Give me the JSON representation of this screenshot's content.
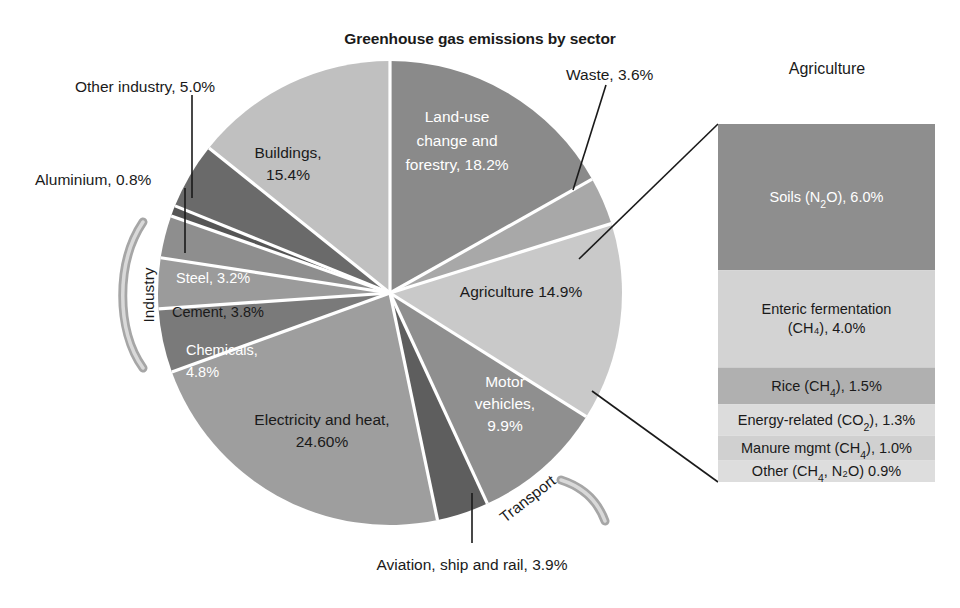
{
  "title": "Greenhouse gas emissions by sector",
  "panel_title": "Agriculture",
  "bracket_labels": {
    "industry": "Industry",
    "transport": "Transport"
  },
  "colors": {
    "land_use": "#8a8a8a",
    "waste": "#a8a8a8",
    "agriculture": "#c9c9c9",
    "motor_vehicles": "#8f8f8f",
    "aviation": "#5e5e5e",
    "electricity": "#9e9e9e",
    "chemicals": "#7a7a7a",
    "cement": "#9b9b9b",
    "steel": "#8e8e8e",
    "aluminium": "#555555",
    "other_industry": "#6a6a6a",
    "buildings": "#c0c0c0",
    "soils": "#8e8e8e",
    "enteric": "#d3d3d3",
    "rice": "#b0b0b0",
    "energy_related": "#dcdcdc",
    "manure": "#d0d0d0",
    "other_ag": "#dddddd",
    "separator": "#ffffff",
    "text_dark": "#1a1a1a",
    "text_light": "#ffffff"
  },
  "chart_data": {
    "type": "pie",
    "title": "Greenhouse gas emissions by sector",
    "xlabel": "",
    "ylabel": "",
    "legend": "none",
    "grid": false,
    "categories": [
      "Land-use change and forestry",
      "Waste",
      "Agriculture",
      "Motor vehicles",
      "Aviation, ship and rail",
      "Electricity and heat",
      "Chemicals",
      "Cement",
      "Steel",
      "Aluminium",
      "Other industry",
      "Buildings"
    ],
    "values": [
      18.2,
      3.6,
      14.9,
      9.9,
      3.9,
      24.6,
      4.8,
      3.8,
      3.2,
      0.8,
      5.0,
      15.4
    ],
    "slice_labels": [
      "Land-use change and forestry, 18.2%",
      "Waste, 3.6%",
      "Agriculture 14.9%",
      "Motor vehicles, 9.9%",
      "Aviation, ship and rail, 3.9%",
      "Electricity and heat, 24.60%",
      "Chemicals, 4.8%",
      "Cement, 3.8%",
      "Steel, 3.2%",
      "Aluminium, 0.8%",
      "Other industry, 5.0%",
      "Buildings, 15.4%"
    ],
    "groups": [
      {
        "name": "Industry",
        "members": [
          "Chemicals",
          "Cement",
          "Steel",
          "Aluminium",
          "Other industry"
        ]
      },
      {
        "name": "Transport",
        "members": [
          "Motor vehicles",
          "Aviation, ship and rail"
        ]
      }
    ]
  },
  "breakout": {
    "type": "stacked_bar",
    "title": "Agriculture",
    "parent_slice": "Agriculture",
    "parent_total": 14.9,
    "categories": [
      "Soils (N2O)",
      "Enteric fermentation (CH4)",
      "Rice (CH4)",
      "Energy-related (CO2)",
      "Manure mgmt (CH4)",
      "Other (CH4, N2O)"
    ],
    "values": [
      6.0,
      4.0,
      1.5,
      1.3,
      1.0,
      0.9
    ],
    "segments": [
      {
        "label_pre": "Soils (N",
        "sub": "2",
        "label_post": "O), 6.0%",
        "value": 6.0,
        "color": "#8e8e8e",
        "text": "#ffffff",
        "lines": 1
      },
      {
        "label_pre": "Enteric fermentation",
        "sub": "",
        "label_post": "(CH₄), 4.0%",
        "value": 4.0,
        "color": "#d3d3d3",
        "text": "#1a1a1a",
        "lines": 2
      },
      {
        "label_pre": "Rice (CH",
        "sub": "4",
        "label_post": "), 1.5%",
        "value": 1.5,
        "color": "#b0b0b0",
        "text": "#1a1a1a",
        "lines": 1
      },
      {
        "label_pre": "Energy-related (CO",
        "sub": "2",
        "label_post": "), 1.3%",
        "value": 1.3,
        "color": "#dcdcdc",
        "text": "#1a1a1a",
        "lines": 1
      },
      {
        "label_pre": "Manure mgmt (CH",
        "sub": "4",
        "label_post": "), 1.0%",
        "value": 1.0,
        "color": "#d0d0d0",
        "text": "#1a1a1a",
        "lines": 1
      },
      {
        "label_pre": "Other (CH",
        "sub": "4",
        "label_post": ", N₂O) 0.9%",
        "value": 0.9,
        "color": "#dddddd",
        "text": "#1a1a1a",
        "lines": 1
      }
    ]
  },
  "callout_labels": {
    "other_industry": "Other industry, 5.0%",
    "aluminium": "Aluminium, 0.8%",
    "waste": "Waste, 3.6%",
    "aviation": "Aviation, ship and rail, 3.9%"
  },
  "inline_labels": {
    "buildings_l1": "Buildings,",
    "buildings_l2": "15.4%",
    "landuse_l1": "Land-use",
    "landuse_l2": "change and",
    "landuse_l3": "forestry, 18.2%",
    "agriculture": "Agriculture 14.9%",
    "motor_l1": "Motor",
    "motor_l2": "vehicles,",
    "motor_l3": "9.9%",
    "electricity_l1": "Electricity and heat,",
    "electricity_l2": "24.60%",
    "chemicals_l1": "Chemicals,",
    "chemicals_l2": "4.8%",
    "cement": "Cement, 3.8%",
    "steel": "Steel, 3.2%"
  }
}
